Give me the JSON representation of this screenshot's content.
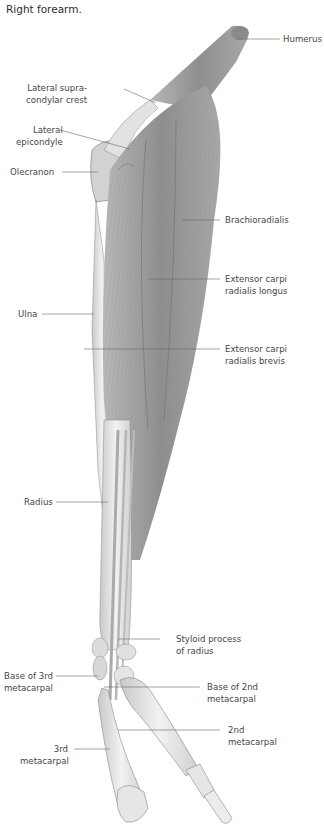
{
  "figure": {
    "title": "Right forearm.",
    "colors": {
      "background": "#ffffff",
      "label_text": "#454545",
      "leader_line": "#6a6a6a",
      "muscle": "#9a9a9a",
      "bone": "#e4e4e4"
    }
  },
  "labels": {
    "humerus": {
      "lines": [
        "Humerus"
      ]
    },
    "lateral_supracondylar_crest": {
      "lines": [
        "Lateral supra-",
        "condylar crest"
      ]
    },
    "lateral_epicondyle": {
      "lines": [
        "Lateral",
        "epicondyle"
      ]
    },
    "olecranon": {
      "lines": [
        "Olecranon"
      ]
    },
    "brachioradialis": {
      "lines": [
        "Brachioradialis"
      ]
    },
    "ecrl": {
      "lines": [
        "Extensor carpi",
        "radialis longus"
      ]
    },
    "ulna": {
      "lines": [
        "Ulna"
      ]
    },
    "ecrb": {
      "lines": [
        "Extensor carpi",
        "radialis brevis"
      ]
    },
    "radius": {
      "lines": [
        "Radius"
      ]
    },
    "styloid_process": {
      "lines": [
        "Styloid process",
        "of radius"
      ]
    },
    "base_3rd_metacarpal": {
      "lines": [
        "Base of 3rd",
        "metacarpal"
      ]
    },
    "base_2nd_metacarpal": {
      "lines": [
        "Base of 2nd",
        "metacarpal"
      ]
    },
    "second_metacarpal": {
      "lines": [
        "2nd",
        "metacarpal"
      ]
    },
    "third_metacarpal": {
      "lines": [
        "3rd",
        "metacarpal"
      ]
    }
  }
}
